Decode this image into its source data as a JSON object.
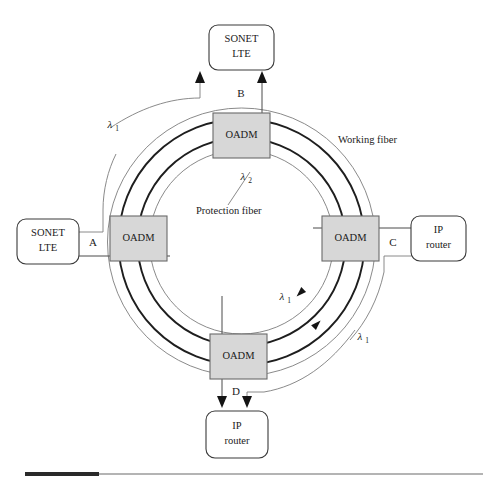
{
  "nodes": {
    "top_terminal": {
      "line1": "SONET",
      "line2": "LTE"
    },
    "left_terminal": {
      "line1": "SONET",
      "line2": "LTE"
    },
    "right_terminal": {
      "line1": "IP",
      "line2": "router"
    },
    "bottom_terminal": {
      "line1": "IP",
      "line2": "router"
    },
    "oadm_top": {
      "label": "OADM"
    },
    "oadm_left": {
      "label": "OADM"
    },
    "oadm_right": {
      "label": "OADM"
    },
    "oadm_bottom": {
      "label": "OADM"
    }
  },
  "points": {
    "a": "A",
    "b": "B",
    "c": "C",
    "d": "D"
  },
  "captions": {
    "working_fiber": "Working fiber",
    "protection_fiber": "Protection fiber"
  },
  "wavelengths": {
    "lambda_upper_left": {
      "symbol": "λ",
      "subscript": "1"
    },
    "lambda_inner_top": {
      "symbol": "λ",
      "subscript": "2"
    },
    "lambda_lower_inner": {
      "symbol": "λ",
      "subscript": "1"
    },
    "lambda_lower_outer": {
      "symbol": "λ",
      "subscript": "1"
    }
  },
  "colors": {
    "oadm_fill": "#d7d7d7",
    "oadm_stroke": "#6a6a6a",
    "ring_thick": "#1e1e1e",
    "ring_thin": "#7d7d7d",
    "terminal_stroke": "#3a3a3a",
    "background": "#ffffff",
    "rule_dark": "#2a2a2a",
    "rule_light": "#b4b4b4"
  }
}
